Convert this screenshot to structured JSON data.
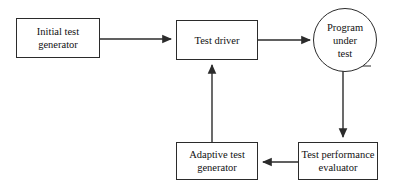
{
  "diagram": {
    "background_color": "#ffffff",
    "stroke_color": "#2b2b2b",
    "text_color": "#111111",
    "nodes": [
      {
        "id": "initial-test-generator",
        "shape": "rectangle",
        "lines": [
          "Initial test",
          "generator"
        ],
        "x": 16,
        "y": 18,
        "w": 84,
        "h": 40
      },
      {
        "id": "test-driver",
        "shape": "rectangle",
        "lines": [
          "Test driver"
        ],
        "x": 176,
        "y": 20,
        "w": 82,
        "h": 40
      },
      {
        "id": "program-under-test",
        "shape": "circle",
        "lines": [
          "Program",
          "under",
          "test"
        ],
        "x": 313,
        "y": 8,
        "w": 64,
        "h": 64
      },
      {
        "id": "adaptive-test-generator",
        "shape": "rectangle",
        "lines": [
          "Adaptive test",
          "generator"
        ],
        "x": 176,
        "y": 142,
        "w": 82,
        "h": 38
      },
      {
        "id": "test-performance-evaluator",
        "shape": "rectangle",
        "lines": [
          "Test performance",
          "evaluator"
        ],
        "x": 298,
        "y": 142,
        "w": 80,
        "h": 38
      }
    ],
    "edges": [
      {
        "id": "initial-to-driver",
        "from": "initial-test-generator",
        "to": "test-driver",
        "direction": "right",
        "path": "M100,39 L171,39"
      },
      {
        "id": "driver-to-program",
        "from": "test-driver",
        "to": "program-under-test",
        "direction": "right",
        "path": "M258,40 L310,40"
      },
      {
        "id": "program-to-evaluator",
        "from": "program-under-test",
        "to": "test-performance-evaluator",
        "direction": "down",
        "path": "M343,68 L343,137"
      },
      {
        "id": "evaluator-to-adaptive",
        "from": "test-performance-evaluator",
        "to": "adaptive-test-generator",
        "direction": "left",
        "path": "M298,162 L263,162"
      },
      {
        "id": "adaptive-to-driver",
        "from": "adaptive-test-generator",
        "to": "test-driver",
        "direction": "up",
        "path": "M212,142 L212,65"
      }
    ]
  }
}
